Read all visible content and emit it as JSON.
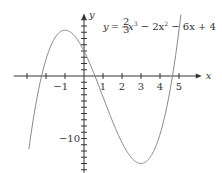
{
  "chart_data": {
    "type": "line",
    "title": "",
    "annotation": {
      "y_var": "y",
      "equals": "=",
      "frac_num": "2",
      "frac_den": "3",
      "terms": "x",
      "exp3": "3",
      "rest1": " − 2x",
      "exp2": "2",
      "rest2": " − 6x + 4",
      "full_text": "y = (2/3)x^3 − 2x^2 − 6x + 4"
    },
    "function": {
      "a3": 0.6667,
      "a2": -2,
      "a1": -6,
      "a0": 4
    },
    "xlabel": "x",
    "ylabel": "y",
    "xlim": [
      -3.7,
      6.2
    ],
    "ylim": [
      -15.5,
      10
    ],
    "x_ticks": [
      -3,
      -2,
      -1,
      0,
      1,
      2,
      3,
      4,
      5
    ],
    "x_tick_labels": [
      {
        "value": -1,
        "text": "−1"
      },
      {
        "value": 1,
        "text": "1"
      },
      {
        "value": 2,
        "text": "2"
      },
      {
        "value": 3,
        "text": "3"
      },
      {
        "value": 4,
        "text": "4"
      },
      {
        "value": 5,
        "text": "5"
      }
    ],
    "y_ticks": [
      9,
      8,
      7,
      6,
      5,
      4,
      3,
      2,
      1,
      -1,
      -2,
      -3,
      -4,
      -5,
      -6,
      -7,
      -8,
      -9,
      -10,
      -11,
      -12,
      -13,
      -14,
      -15
    ],
    "y_tick_labels": [
      {
        "value": -10,
        "text": "−10"
      }
    ],
    "curve_domain": [
      -2.9,
      5.1
    ],
    "key_points": [
      {
        "x": -1,
        "y": 7.33,
        "label": "local max"
      },
      {
        "x": 3,
        "y": -14,
        "label": "local min"
      },
      {
        "x": 0,
        "y": 4,
        "label": "y-intercept"
      }
    ],
    "grid": false,
    "colors": {
      "axis": "#333333",
      "curve": "#888888"
    }
  }
}
